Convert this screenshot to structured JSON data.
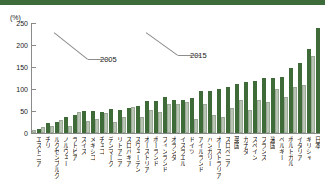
{
  "chart_data": {
    "type": "bar",
    "title": "",
    "subtitle": "",
    "xlabel": "",
    "ylabel": "",
    "unit_label": "(%)",
    "ylim": [
      0,
      250
    ],
    "yticks": [
      0,
      50,
      100,
      150,
      200,
      250
    ],
    "grid": false,
    "legend_position": "inline-annotation",
    "categories": [
      "エストニア",
      "チリ",
      "ルクセンブルク",
      "ノルウェー",
      "ラトビア",
      "スイス",
      "メキシコ",
      "チェコ",
      "デンマーク",
      "リトアニア",
      "スロバキア",
      "スウェーデン",
      "オーストリア",
      "ポーランド",
      "フィンランド",
      "オランダ",
      "イスラエル",
      "ドイツ",
      "アイルランド",
      "ハンガリー",
      "オーストラリア",
      "スロベニア",
      "英国",
      "カナダ",
      "スペイン",
      "フランス",
      "米国",
      "ベルギー",
      "ポルトガル",
      "イタリア",
      "ギリシャ",
      "日本"
    ],
    "series": [
      {
        "name": "2005",
        "color": "#b9c4b4",
        "values": [
          6,
          14,
          16,
          30,
          16,
          47,
          28,
          32,
          45,
          25,
          37,
          60,
          36,
          53,
          47,
          65,
          66,
          70,
          32,
          66,
          40,
          36,
          56,
          75,
          52,
          75,
          70,
          100,
          82,
          104,
          110,
          175
        ]
      },
      {
        "name": "2015",
        "color": "#3f6b39",
        "values": [
          10,
          22,
          24,
          36,
          40,
          50,
          50,
          48,
          54,
          52,
          56,
          62,
          72,
          72,
          82,
          76,
          75,
          80,
          95,
          96,
          100,
          104,
          112,
          116,
          118,
          124,
          126,
          128,
          148,
          158,
          190,
          238
        ]
      }
    ],
    "annotations": [
      {
        "label": "2005",
        "points_to_series": "2005",
        "points_to_category": "メキシコ"
      },
      {
        "label": "2015",
        "points_to_series": "2015",
        "points_to_category": "オランダ"
      }
    ]
  }
}
